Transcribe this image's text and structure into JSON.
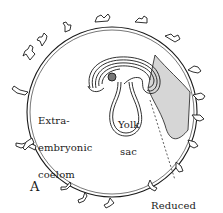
{
  "figure": {
    "panel_label": "A",
    "colors": {
      "ink": "#1a1a1a",
      "background": "#ffffff",
      "stipple": "#bdbdbd"
    }
  },
  "labels": {
    "extra_embryonic_coelom": [
      "Extra-",
      "embryonic",
      "coelom"
    ],
    "yolk_sac": [
      "Yolk",
      "sac"
    ],
    "reduced_allantoic_lumen": [
      "Reduced",
      "allantoic",
      "lumen"
    ]
  }
}
